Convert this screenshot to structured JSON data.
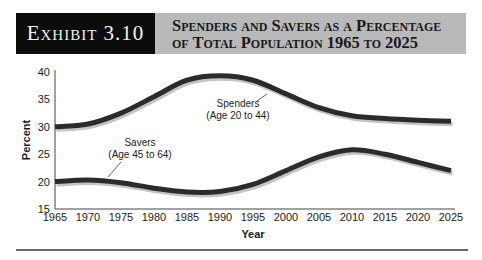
{
  "header": {
    "exhibit_label": "Exhibit 3.10",
    "title_line1": "Spenders and Savers as a Percentage",
    "title_line2": "of Total Population 1965 to 2025"
  },
  "colors": {
    "line": "#2b2b2b",
    "shadow": "#c4c4c4",
    "header_dark": "#0c0c0c",
    "header_gray": "#b9b9b9"
  },
  "chart_data": {
    "type": "line",
    "title": "Spenders and Savers as a Percentage of Total Population 1965 to 2025",
    "xlabel": "Year",
    "ylabel": "Percent",
    "x": [
      1965,
      1970,
      1975,
      1980,
      1985,
      1990,
      1995,
      2000,
      2005,
      2010,
      2015,
      2020,
      2025
    ],
    "ylim": [
      15,
      40
    ],
    "yticks": [
      15,
      20,
      25,
      30,
      35,
      40
    ],
    "xticks": [
      1965,
      1970,
      1975,
      1980,
      1985,
      1990,
      1995,
      2000,
      2005,
      2010,
      2015,
      2020,
      2025
    ],
    "grid": false,
    "series": [
      {
        "name": "Spenders",
        "annotation_line1": "Spenders",
        "annotation_line2": "(Age 20 to 44)",
        "values": [
          30,
          30.5,
          32.5,
          35.5,
          38.5,
          39.3,
          38.5,
          36,
          33.5,
          32,
          31.5,
          31.2,
          31
        ]
      },
      {
        "name": "Savers",
        "annotation_line1": "Savers",
        "annotation_line2": "(Age 45 to 64)",
        "values": [
          20,
          20.3,
          19.8,
          18.8,
          18.1,
          18.2,
          19.5,
          22,
          24.5,
          25.8,
          25,
          23.5,
          22
        ]
      }
    ]
  }
}
